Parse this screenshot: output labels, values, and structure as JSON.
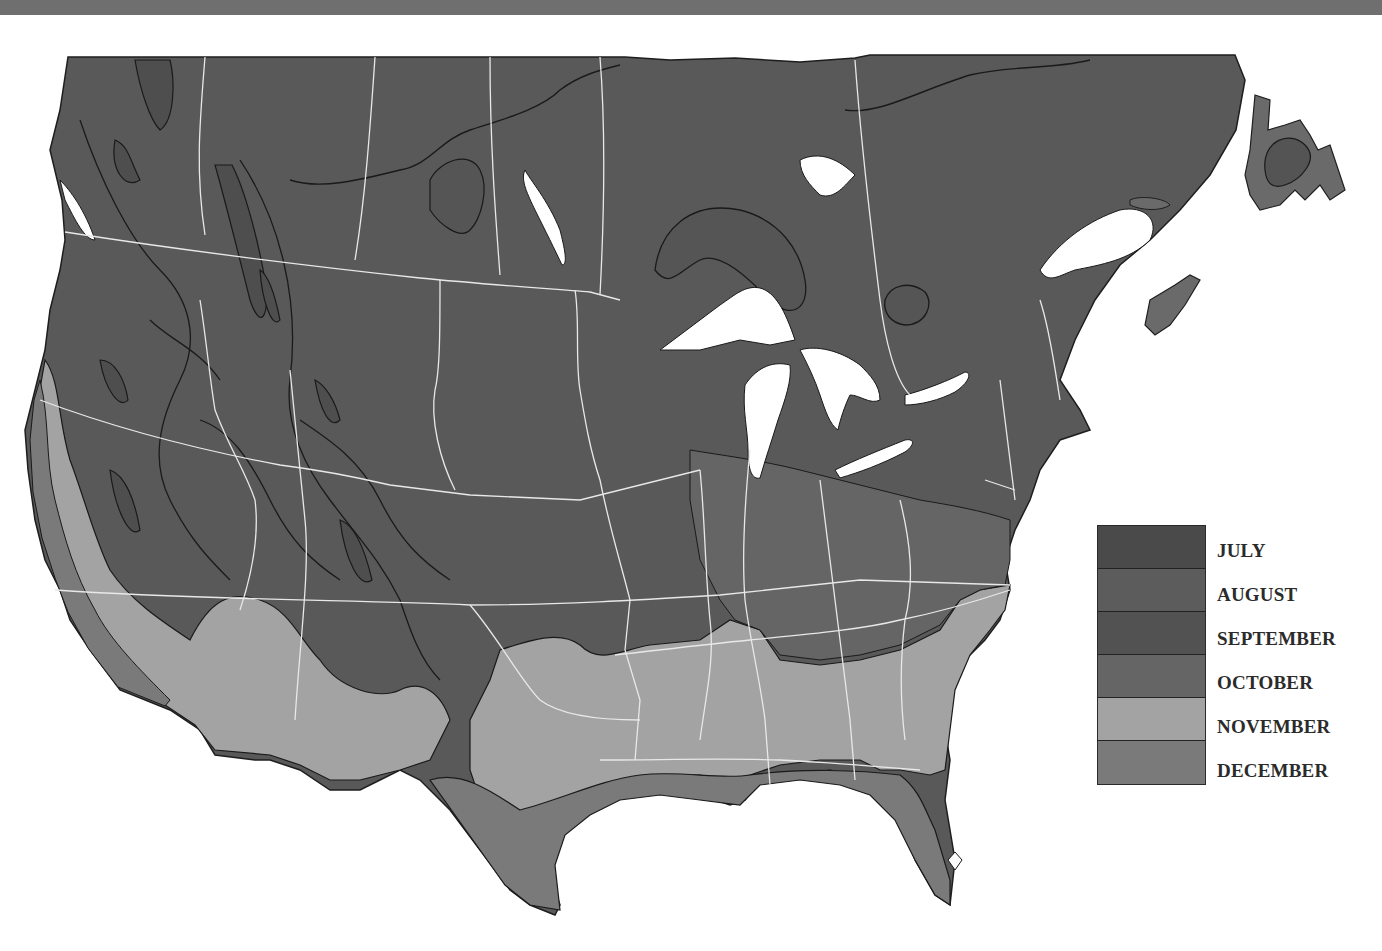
{
  "map": {
    "subject": "North America first-frost month zones",
    "water_color": "#ffffff",
    "border_color": "#e8e8e8",
    "contour_color": "#1a1a1a"
  },
  "legend": {
    "items": [
      {
        "label": "JULY",
        "color": "#4a4a4a"
      },
      {
        "label": "AUGUST",
        "color": "#5c5c5c"
      },
      {
        "label": "SEPTEMBER",
        "color": "#525252"
      },
      {
        "label": "OCTOBER",
        "color": "#656565"
      },
      {
        "label": "NOVEMBER",
        "color": "#a3a3a3"
      },
      {
        "label": "DECEMBER",
        "color": "#7a7a7a"
      }
    ]
  }
}
